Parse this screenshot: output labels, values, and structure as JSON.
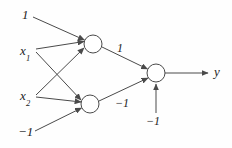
{
  "diagram": {
    "stroke_color": "#4a4a4a",
    "text_color": "#1c1c1c",
    "background": "#fefefe",
    "node_fill": "#ffffff",
    "inputs": [
      {
        "id": "bias-top",
        "label": "1",
        "x": 22,
        "y": 16
      },
      {
        "id": "x1",
        "label": "x",
        "subscript": "1",
        "x": 20,
        "y": 51
      },
      {
        "id": "x2",
        "label": "x",
        "subscript": "2",
        "x": 20,
        "y": 96
      },
      {
        "id": "bias-bottom",
        "label": "−1",
        "x": 21,
        "y": 133
      }
    ],
    "weights": [
      {
        "id": "w-top-out",
        "label": "1",
        "x": 120,
        "y": 49
      },
      {
        "id": "w-bottom-out",
        "label": "−1",
        "x": 121,
        "y": 104
      },
      {
        "id": "w-output-bias",
        "label": "−1",
        "x": 150,
        "y": 122
      }
    ],
    "outputs": [
      {
        "id": "y",
        "label": "y",
        "x": 217,
        "y": 73
      }
    ],
    "nodes": [
      {
        "id": "hidden-1",
        "cx": 93,
        "cy": 44,
        "r": 9
      },
      {
        "id": "hidden-2",
        "cx": 90,
        "cy": 104,
        "r": 9
      },
      {
        "id": "output-1",
        "cx": 156,
        "cy": 73,
        "r": 9
      }
    ]
  }
}
